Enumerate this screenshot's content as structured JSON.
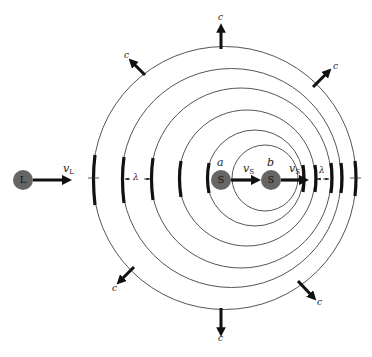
{
  "diagram": {
    "colors": {
      "background": "#ffffff",
      "wavefront": "#555555",
      "arrow": "#111111",
      "disc": "#666666"
    },
    "wavefronts": [
      {
        "cx": 224.5,
        "cy": 178,
        "r": 131.5
      },
      {
        "cx": 231.5,
        "cy": 178,
        "r": 109.5
      },
      {
        "cx": 241,
        "cy": 178,
        "r": 90
      },
      {
        "cx": 247,
        "cy": 178,
        "r": 68
      },
      {
        "cx": 255,
        "cy": 178,
        "r": 48
      },
      {
        "cx": 265,
        "cy": 178,
        "r": 33
      }
    ],
    "listener": {
      "label": "L",
      "x": 23,
      "y": 180,
      "velocity_label": "v",
      "velocity_sub": "L"
    },
    "sources": [
      {
        "position_label": "a",
        "label": "S",
        "x": 221,
        "y": 180,
        "velocity_label": "v",
        "velocity_sub": "S"
      },
      {
        "position_label": "b",
        "label": "S",
        "x": 271,
        "y": 180,
        "velocity_label": "v",
        "velocity_sub": "S"
      }
    ],
    "wave_speed_label": "c",
    "wavelength_label": "λ"
  }
}
